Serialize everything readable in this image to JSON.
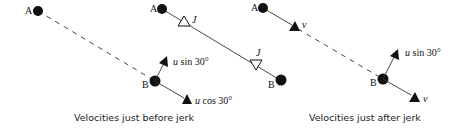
{
  "figure": {
    "panels": [
      {
        "id": "before",
        "caption": "Velocities just before jerk",
        "points": {
          "A": "A",
          "B": "B"
        },
        "string": "dashed (slack)",
        "arrows": [
          {
            "label_var": "u",
            "label_rest": " sin 30°"
          },
          {
            "label_var": "u",
            "label_rest": " cos 30°"
          }
        ]
      },
      {
        "id": "impulse",
        "caption": "",
        "points": {
          "A": "A",
          "B": "B"
        },
        "string": "taut",
        "impulses": [
          {
            "label": "J"
          },
          {
            "label": "J"
          }
        ]
      },
      {
        "id": "after",
        "caption": "Velocities just after jerk",
        "points": {
          "A": "A",
          "B": "B"
        },
        "string": "dashed",
        "arrows": [
          {
            "label_var": "v",
            "label_rest": ""
          },
          {
            "label_var": "u",
            "label_rest": " sin 30°"
          },
          {
            "label_var": "v",
            "label_rest": ""
          }
        ]
      }
    ],
    "colors": {
      "ink": "#111111",
      "line": "#333333",
      "background": "#ffffff"
    }
  }
}
